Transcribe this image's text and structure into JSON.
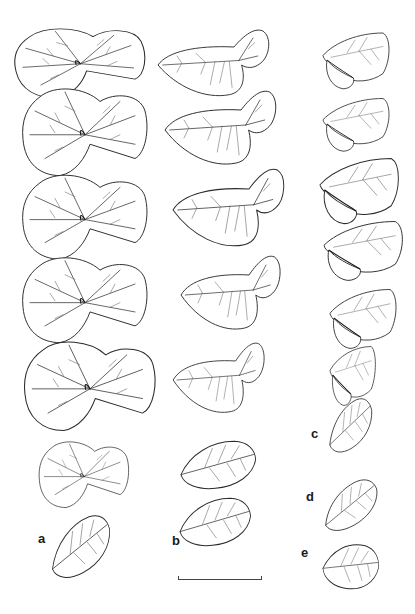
{
  "figure": {
    "background": "#ffffff",
    "line_color": "#2a2a2a"
  },
  "labels": [
    {
      "id": "a",
      "text": "a",
      "x": 40,
      "y": 532
    },
    {
      "id": "b",
      "text": "b",
      "x": 174,
      "y": 534
    },
    {
      "id": "c",
      "text": "c",
      "x": 312,
      "y": 428
    },
    {
      "id": "d",
      "text": "d",
      "x": 307,
      "y": 491
    },
    {
      "id": "e",
      "text": "e",
      "x": 301,
      "y": 546
    }
  ],
  "columns": [
    {
      "id": "a",
      "leaf_count": 7,
      "type": "paired-leaflets"
    },
    {
      "id": "b",
      "leaf_count": 7,
      "type": "unequal-leaflets"
    },
    {
      "id": "c",
      "leaf_count": 7,
      "type": "folded-leaflets"
    }
  ],
  "singles": [
    {
      "id": "d",
      "type": "single-leaflet"
    },
    {
      "id": "e",
      "type": "single-leaflet"
    }
  ],
  "scale_bar": {
    "x1": 178,
    "x2": 260,
    "y": 578,
    "label": ""
  }
}
